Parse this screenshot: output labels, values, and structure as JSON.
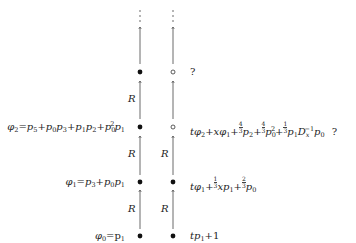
{
  "diagram": {
    "columns": {
      "left": {
        "x": 140,
        "dot_style": "filled"
      },
      "right": {
        "x": 173
      }
    },
    "edge_label": "R",
    "continuation": "⋮",
    "rows": [
      {
        "level": 0,
        "left_formula": "φ0 = p1",
        "left_dot": "filled",
        "right_dot": "filled",
        "right_formula": "t p1 + 1"
      },
      {
        "level": 1,
        "left_formula": "φ1 = p3 + p0 p1",
        "left_dot": "filled",
        "right_dot": "filled",
        "right_formula": "t φ1 + 1/3 x p1 + 2/3 p0"
      },
      {
        "level": 2,
        "left_formula": "φ2 = p5 + p0 p3 + p1 p2 + p0^2 p1",
        "left_dot": "filled",
        "right_dot": "open",
        "right_formula": "t φ2 + x φ1 + 4/3 p2 + 4/3 p0^2 + 1/3 p1 Dx^-1 p0",
        "right_note": "?"
      },
      {
        "level": 3,
        "left_formula": "",
        "left_dot": "filled",
        "right_dot": "open",
        "right_formula": "",
        "right_note": "?"
      }
    ],
    "text": {
      "phi0_lhs": "φ",
      "phi0_sub": "0",
      "phi0_eq": "=p",
      "phi0_p_sub": "1",
      "r0_t": "t",
      "r0_p": "p",
      "r0_sub": "1",
      "r0_tail": "+1",
      "q": "?",
      "R": "R",
      "vdots": "⋮"
    }
  }
}
